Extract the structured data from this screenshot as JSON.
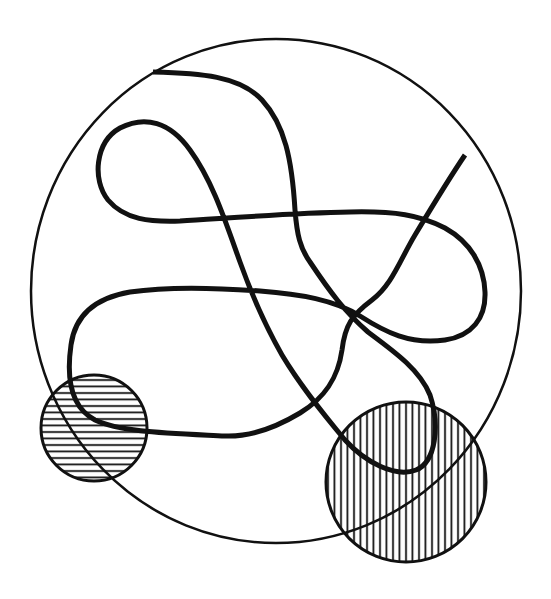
{
  "diagram": {
    "colors": {
      "background": "#ffffff",
      "stroke": "#111111"
    },
    "outer_circle": {
      "cx": 276,
      "cy": 291,
      "rx": 245,
      "ry": 252,
      "stroke_width": 2.5
    },
    "small_hatched_circle": {
      "cx": 94,
      "cy": 428,
      "r": 53,
      "hatch": "horizontal",
      "hatch_spacing": 6.5
    },
    "large_hatched_circle": {
      "cx": 406,
      "cy": 482,
      "r": 80,
      "hatch": "vertical",
      "hatch_spacing": 6.5
    },
    "curve": {
      "stroke_width": 5,
      "path": "M153,72 C200,73 240,76 262,100 C285,125 292,160 295,210 C297,235 300,248 310,262 C330,292 345,312 368,332 C395,352 420,370 430,395 C440,425 436,462 416,470 C395,478 365,462 345,440 C320,410 300,385 282,355 C262,320 250,290 240,262 C225,220 212,180 190,150 C170,122 145,115 120,128 C95,142 92,180 108,200 C125,220 150,222 180,221 C230,218 290,213 350,212 C395,211 420,215 445,228 C470,242 484,265 485,292 C486,318 472,336 445,340 C410,345 385,332 360,316 C335,300 300,294 260,291 C220,288 170,286 130,292 C95,298 75,315 71,345 C66,380 72,408 95,420 C120,432 165,433 225,436 C250,437 275,428 300,413 C325,398 338,378 342,350 C345,325 352,315 372,300 C392,285 400,260 415,235 C430,210 448,180 465,155",
      "crossing_arcs_note": "curve is drawn as one continuous stroke"
    }
  }
}
